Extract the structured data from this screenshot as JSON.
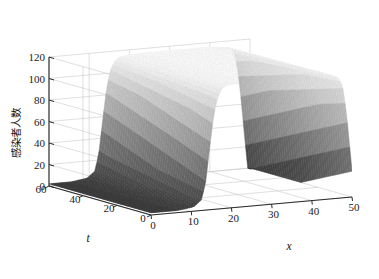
{
  "chart_data": {
    "type": "surface",
    "title": "",
    "xlabel": "x",
    "ylabel": "t",
    "zlabel": "感染者人数",
    "xlim": [
      0,
      50
    ],
    "ylim": [
      0,
      60
    ],
    "zlim": [
      0,
      120
    ],
    "xticks": [
      0,
      10,
      20,
      30,
      40,
      50
    ],
    "yticks": [
      0,
      20,
      40,
      60
    ],
    "zticks": [
      0,
      20,
      40,
      60,
      80,
      100,
      120
    ],
    "xtick_labels": [
      "0",
      "10",
      "20",
      "30",
      "40",
      "50"
    ],
    "ytick_labels": [
      "0",
      "20",
      "40",
      "60"
    ],
    "ztick_labels": [
      "0",
      "20",
      "40",
      "60",
      "80",
      "100",
      "120"
    ],
    "grid": true,
    "legend": "none",
    "colormap": "gray",
    "colormap_low": "#3c3c3c",
    "colormap_high": "#fdfdfd",
    "surface_description": "Traveling wave front: near-zero plateau for small x, steep rise around x=14, broad flat crest near z=115 across 18<x<47, sharp cliff down to 0 at x=50; profile nearly independent of t",
    "profile_x": [
      0,
      2,
      4,
      6,
      8,
      10,
      12,
      13,
      14,
      15,
      16,
      17,
      18,
      20,
      24,
      28,
      32,
      36,
      40,
      43,
      45,
      46,
      47,
      48,
      49,
      50
    ],
    "profile_z": [
      2,
      2,
      2,
      2,
      3,
      4,
      10,
      26,
      58,
      88,
      104,
      111,
      114,
      115,
      116,
      116,
      116,
      116,
      116,
      115,
      114,
      112,
      105,
      80,
      40,
      0
    ],
    "axis_color": "#2b2b2b",
    "grid_color": "#c9c9c9",
    "background": "#ffffff"
  },
  "axes": {
    "z_label": "感染者人数",
    "x_label": "x",
    "t_label": "t"
  }
}
